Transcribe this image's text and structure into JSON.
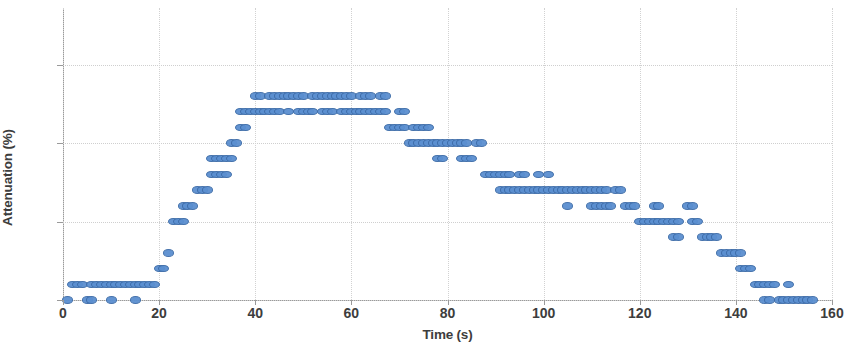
{
  "chart_data": {
    "type": "scatter",
    "title": "",
    "xlabel": "Time (s)",
    "ylabel": "Attenuation (%)",
    "xlim": [
      0,
      160
    ],
    "ylim": [
      0,
      18.6
    ],
    "xticks": [
      0,
      20,
      40,
      60,
      80,
      100,
      120,
      140,
      160
    ],
    "yticks": [
      0,
      5,
      10,
      15
    ],
    "grid": true,
    "legend": null,
    "marker_color": "#5b8fd0",
    "marker_edge_color": "#3d6ca8",
    "series": [
      {
        "name": "Attenuation",
        "points": [
          [
            1,
            0
          ],
          [
            2,
            1
          ],
          [
            3,
            1
          ],
          [
            4,
            1
          ],
          [
            5,
            0
          ],
          [
            6,
            0
          ],
          [
            6,
            1
          ],
          [
            7,
            1
          ],
          [
            8,
            1
          ],
          [
            9,
            1
          ],
          [
            10,
            0
          ],
          [
            10,
            1
          ],
          [
            11,
            1
          ],
          [
            12,
            1
          ],
          [
            13,
            1
          ],
          [
            14,
            1
          ],
          [
            15,
            0
          ],
          [
            15,
            1
          ],
          [
            16,
            1
          ],
          [
            17,
            1
          ],
          [
            18,
            1
          ],
          [
            19,
            1
          ],
          [
            20,
            2
          ],
          [
            21,
            2
          ],
          [
            22,
            3
          ],
          [
            23,
            5
          ],
          [
            24,
            5
          ],
          [
            25,
            5
          ],
          [
            25,
            6
          ],
          [
            26,
            6
          ],
          [
            27,
            6
          ],
          [
            28,
            7
          ],
          [
            29,
            7
          ],
          [
            30,
            7
          ],
          [
            31,
            8
          ],
          [
            32,
            8
          ],
          [
            33,
            8
          ],
          [
            34,
            8
          ],
          [
            31,
            9
          ],
          [
            32,
            9
          ],
          [
            33,
            9
          ],
          [
            34,
            9
          ],
          [
            35,
            9
          ],
          [
            35,
            10
          ],
          [
            36,
            10
          ],
          [
            37,
            11
          ],
          [
            38,
            11
          ],
          [
            37,
            12
          ],
          [
            38,
            12
          ],
          [
            39,
            12
          ],
          [
            40,
            12
          ],
          [
            41,
            12
          ],
          [
            40,
            13
          ],
          [
            41,
            13
          ],
          [
            43,
            13
          ],
          [
            44,
            13
          ],
          [
            45,
            13
          ],
          [
            42,
            12
          ],
          [
            43,
            12
          ],
          [
            44,
            12
          ],
          [
            45,
            12
          ],
          [
            46,
            13
          ],
          [
            47,
            13
          ],
          [
            48,
            13
          ],
          [
            49,
            13
          ],
          [
            50,
            13
          ],
          [
            47,
            12
          ],
          [
            49,
            12
          ],
          [
            50,
            12
          ],
          [
            51,
            12
          ],
          [
            52,
            12
          ],
          [
            52,
            13
          ],
          [
            53,
            13
          ],
          [
            54,
            13
          ],
          [
            55,
            13
          ],
          [
            56,
            13
          ],
          [
            54,
            12
          ],
          [
            55,
            12
          ],
          [
            56,
            12
          ],
          [
            57,
            13
          ],
          [
            58,
            13
          ],
          [
            59,
            13
          ],
          [
            60,
            13
          ],
          [
            58,
            12
          ],
          [
            59,
            12
          ],
          [
            60,
            12
          ],
          [
            61,
            12
          ],
          [
            62,
            13
          ],
          [
            63,
            13
          ],
          [
            64,
            13
          ],
          [
            62,
            12
          ],
          [
            63,
            12
          ],
          [
            64,
            12
          ],
          [
            65,
            12
          ],
          [
            66,
            12
          ],
          [
            67,
            12
          ],
          [
            66,
            13
          ],
          [
            67,
            13
          ],
          [
            68,
            11
          ],
          [
            69,
            11
          ],
          [
            70,
            11
          ],
          [
            71,
            11
          ],
          [
            70,
            12
          ],
          [
            71,
            12
          ],
          [
            72,
            10
          ],
          [
            73,
            10
          ],
          [
            74,
            10
          ],
          [
            75,
            10
          ],
          [
            76,
            10
          ],
          [
            77,
            10
          ],
          [
            73,
            11
          ],
          [
            74,
            11
          ],
          [
            75,
            11
          ],
          [
            76,
            11
          ],
          [
            78,
            9
          ],
          [
            79,
            9
          ],
          [
            78,
            10
          ],
          [
            79,
            10
          ],
          [
            80,
            10
          ],
          [
            81,
            10
          ],
          [
            82,
            10
          ],
          [
            83,
            10
          ],
          [
            84,
            10
          ],
          [
            83,
            9
          ],
          [
            84,
            9
          ],
          [
            85,
            9
          ],
          [
            86,
            10
          ],
          [
            87,
            10
          ],
          [
            88,
            8
          ],
          [
            89,
            8
          ],
          [
            90,
            8
          ],
          [
            91,
            7
          ],
          [
            92,
            7
          ],
          [
            93,
            7
          ],
          [
            91,
            8
          ],
          [
            92,
            8
          ],
          [
            93,
            8
          ],
          [
            94,
            7
          ],
          [
            95,
            7
          ],
          [
            96,
            7
          ],
          [
            97,
            7
          ],
          [
            95,
            8
          ],
          [
            96,
            8
          ],
          [
            98,
            7
          ],
          [
            99,
            7
          ],
          [
            100,
            7
          ],
          [
            101,
            7
          ],
          [
            102,
            7
          ],
          [
            99,
            8
          ],
          [
            101,
            8
          ],
          [
            103,
            7
          ],
          [
            104,
            7
          ],
          [
            105,
            7
          ],
          [
            106,
            7
          ],
          [
            105,
            6
          ],
          [
            107,
            7
          ],
          [
            108,
            7
          ],
          [
            109,
            7
          ],
          [
            110,
            7
          ],
          [
            111,
            7
          ],
          [
            112,
            7
          ],
          [
            113,
            7
          ],
          [
            110,
            6
          ],
          [
            111,
            6
          ],
          [
            112,
            6
          ],
          [
            113,
            6
          ],
          [
            114,
            6
          ],
          [
            115,
            7
          ],
          [
            116,
            7
          ],
          [
            117,
            6
          ],
          [
            118,
            6
          ],
          [
            119,
            6
          ],
          [
            120,
            5
          ],
          [
            121,
            5
          ],
          [
            122,
            5
          ],
          [
            123,
            6
          ],
          [
            124,
            6
          ],
          [
            123,
            5
          ],
          [
            124,
            5
          ],
          [
            125,
            5
          ],
          [
            126,
            5
          ],
          [
            127,
            5
          ],
          [
            128,
            5
          ],
          [
            127,
            4
          ],
          [
            128,
            4
          ],
          [
            130,
            6
          ],
          [
            131,
            6
          ],
          [
            131,
            5
          ],
          [
            132,
            5
          ],
          [
            133,
            4
          ],
          [
            134,
            4
          ],
          [
            135,
            4
          ],
          [
            136,
            4
          ],
          [
            137,
            3
          ],
          [
            138,
            3
          ],
          [
            139,
            3
          ],
          [
            140,
            3
          ],
          [
            141,
            3
          ],
          [
            141,
            2
          ],
          [
            142,
            2
          ],
          [
            143,
            2
          ],
          [
            144,
            1
          ],
          [
            145,
            1
          ],
          [
            146,
            1
          ],
          [
            147,
            1
          ],
          [
            148,
            1
          ],
          [
            146,
            0
          ],
          [
            147,
            0
          ],
          [
            149,
            0
          ],
          [
            150,
            0
          ],
          [
            151,
            0
          ],
          [
            152,
            0
          ],
          [
            153,
            0
          ],
          [
            151,
            1
          ],
          [
            154,
            0
          ],
          [
            155,
            0
          ],
          [
            156,
            0
          ]
        ]
      }
    ]
  },
  "axes": {
    "y_title": "Attenuation (%)",
    "x_title": "Time (s)",
    "y_tick_labels": [
      "0",
      "5",
      "10",
      "15"
    ],
    "x_tick_labels": [
      "0",
      "20",
      "40",
      "60",
      "80",
      "100",
      "120",
      "140",
      "160"
    ]
  }
}
